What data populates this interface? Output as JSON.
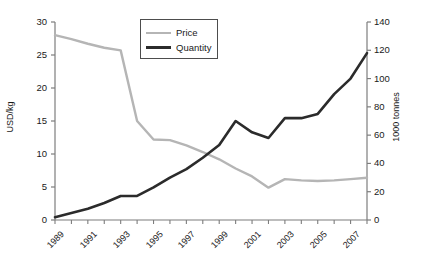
{
  "chart_data": {
    "type": "line",
    "title": "",
    "xlabel": "",
    "grid": false,
    "legend_position": "top-center",
    "x": [
      1989,
      1990,
      1991,
      1992,
      1993,
      1994,
      1995,
      1996,
      1997,
      1998,
      1999,
      2000,
      2001,
      2002,
      2003,
      2004,
      2005,
      2006,
      2007,
      2008
    ],
    "xtick_labels": [
      "1989",
      "1991",
      "1993",
      "1995",
      "1997",
      "1999",
      "2001",
      "2003",
      "2005",
      "2007"
    ],
    "xtick_values": [
      1989,
      1991,
      1993,
      1995,
      1997,
      1999,
      2001,
      2003,
      2005,
      2007
    ],
    "xlim": [
      1989,
      2008
    ],
    "axes": [
      {
        "id": "left",
        "ylabel": "USD/kg",
        "ylim": [
          0,
          30
        ],
        "yticks": [
          0,
          5,
          10,
          15,
          20,
          25,
          30
        ],
        "ytick_labels": [
          "0",
          "5",
          "10",
          "15",
          "20",
          "25",
          "30"
        ]
      },
      {
        "id": "right",
        "ylabel": "1000 tonnes",
        "ylim": [
          0,
          140
        ],
        "yticks": [
          0,
          20,
          40,
          60,
          80,
          100,
          120,
          140
        ],
        "ytick_labels": [
          "0",
          "20",
          "40",
          "60",
          "80",
          "100",
          "120",
          "140"
        ]
      }
    ],
    "series": [
      {
        "name": "Price",
        "axis": "left",
        "unit": "USD/kg",
        "color": "#b5b5b5",
        "values": [
          28.0,
          27.4,
          26.7,
          26.1,
          25.7,
          15.0,
          12.2,
          12.1,
          11.3,
          10.3,
          9.2,
          7.8,
          6.6,
          4.9,
          6.2,
          6.0,
          5.9,
          6.0,
          6.2,
          6.4
        ]
      },
      {
        "name": "Quantity",
        "axis": "right",
        "unit": "1000 tonnes",
        "color": "#2b2b2b",
        "values": [
          2,
          5,
          8,
          12,
          17,
          17,
          23,
          30,
          36,
          44,
          53,
          70,
          62,
          58,
          72,
          72,
          75,
          89,
          100,
          118
        ]
      }
    ]
  },
  "legend": {
    "items": [
      {
        "label": "Price"
      },
      {
        "label": "Quantity"
      }
    ]
  }
}
